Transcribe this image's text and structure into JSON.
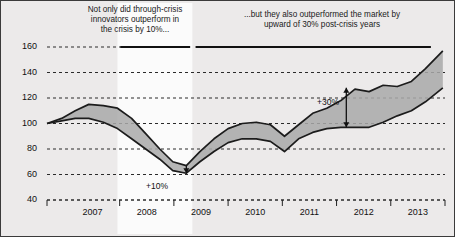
{
  "annotations": {
    "left_callout": {
      "lines": [
        "Not only did through-crisis",
        "innovators outperform in",
        "the crisis by 10%..."
      ]
    },
    "right_callout": {
      "lines": [
        "...but they also outperformed the market by",
        "upward of 30% post-crisis years"
      ]
    },
    "gap_low_label": "+10%",
    "gap_high_label": "+30%"
  },
  "colors": {
    "band_fill": "#a9a9a9",
    "line": "#1c1c1c",
    "grid": "#2a2a2a",
    "background": "#eceaea",
    "highlight_band": "#fbfbfb",
    "frame": "#3b3b3b"
  },
  "chart_data": {
    "type": "area",
    "title": "",
    "subtitle": "",
    "xlabel": "",
    "ylabel": "",
    "xlim": [
      2006.58,
      2013.92
    ],
    "ylim": [
      40,
      160
    ],
    "grid": true,
    "legend_position": "none",
    "yticks": [
      40,
      60,
      80,
      100,
      120,
      140,
      160
    ],
    "ytick_labels": [
      "40",
      "60",
      "80",
      "100",
      "120",
      "140",
      "160"
    ],
    "xticks": [
      2007,
      2008,
      2009,
      2010,
      2011,
      2012,
      2013
    ],
    "xtick_labels": [
      "2007",
      "2008",
      "2009",
      "2010",
      "2011",
      "2012",
      "2013"
    ],
    "x": [
      2006.58,
      2006.85,
      2007.1,
      2007.35,
      2007.62,
      2007.88,
      2008.14,
      2008.4,
      2008.66,
      2008.9,
      2009.15,
      2009.4,
      2009.66,
      2009.92,
      2010.18,
      2010.44,
      2010.7,
      2010.96,
      2011.22,
      2011.48,
      2011.74,
      2012.0,
      2012.26,
      2012.52,
      2012.78,
      2013.04,
      2013.3,
      2013.56,
      2013.88
    ],
    "series": [
      {
        "name": "Through-crisis innovators",
        "values": [
          100,
          104,
          110,
          115,
          114,
          112,
          104,
          92,
          80,
          70,
          67,
          78,
          88,
          96,
          100,
          101,
          99,
          90,
          99,
          108,
          112,
          118,
          127,
          125,
          130,
          129,
          133,
          143,
          157
        ]
      },
      {
        "name": "Market",
        "values": [
          100,
          102,
          104,
          104,
          101,
          96,
          88,
          80,
          72,
          63,
          61,
          70,
          78,
          85,
          88,
          88,
          86,
          78,
          88,
          93,
          96,
          97,
          97,
          97,
          101,
          106,
          110,
          117,
          128
        ]
      }
    ],
    "annotation_markers": [
      {
        "label": "+10%",
        "x": 2009.15,
        "y_from": 67,
        "y_to": 61,
        "style": "single-arrow-down"
      },
      {
        "label": "+30%",
        "x": 2012.1,
        "y_from": 128,
        "y_to": 97,
        "style": "double-arrow-vertical"
      }
    ],
    "highlight_band": {
      "x_from": 2007.88,
      "x_to": 2009.26
    },
    "top_bars": [
      {
        "y": 160,
        "x_from": 2007.93,
        "x_to": 2009.22
      },
      {
        "y": 160,
        "x_from": 2009.32,
        "x_to": 2013.66
      }
    ]
  }
}
